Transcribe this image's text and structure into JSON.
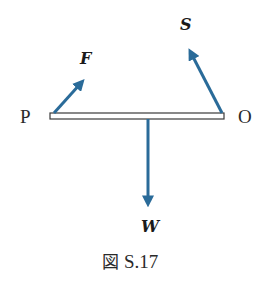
{
  "figure": {
    "caption_prefix": "図",
    "caption_number": "S.17",
    "colors": {
      "arrow": "#2a6b99",
      "bar_outline": "#3a3a3a",
      "bar_fill": "#ffffff",
      "text": "#2a2a2a"
    },
    "bar": {
      "left_point_label": "P",
      "right_point_label": "O"
    },
    "forces": [
      {
        "id": "F",
        "label": "F",
        "description": "force at P, pointing up-right"
      },
      {
        "id": "S",
        "label": "S",
        "description": "force at O, pointing up-left"
      },
      {
        "id": "W",
        "label": "W",
        "description": "weight at center, pointing down"
      }
    ]
  }
}
